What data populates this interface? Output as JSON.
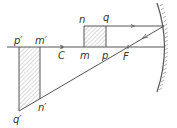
{
  "diagram": {
    "type": "concave-mirror-ray-diagram",
    "colors": {
      "line": "#555555",
      "hatch": "#9a9a9a",
      "label": "#333333",
      "background": "#ffffff"
    },
    "labels": {
      "n": "n",
      "q": "q",
      "m": "m",
      "p": "p",
      "C": "C",
      "F": "F",
      "p_prime": "p′",
      "m_prime": "m′",
      "n_prime": "n′",
      "q_prime": "q′"
    },
    "elements": {
      "principal_axis": "principal axis",
      "mirror": "concave mirror",
      "object": "object mnqp",
      "image": "image p′m′n′q′",
      "incident_ray": "ray parallel to axis",
      "reflected_ray": "ray through focus F"
    }
  }
}
